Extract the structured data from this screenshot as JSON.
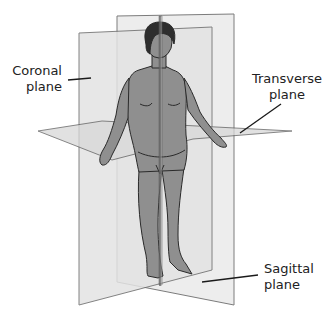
{
  "diagram": {
    "labels": {
      "coronal": {
        "line1": "Coronal",
        "line2": "plane"
      },
      "transverse": {
        "line1": "Transverse",
        "line2": "plane"
      },
      "sagittal": {
        "line1": "Sagittal",
        "line2": "plane"
      }
    },
    "colors": {
      "plane_fill": "#e6e6e6",
      "plane_stroke": "#6e6e6e",
      "body_fill": "#8f8f8f",
      "body_stroke": "#2a2a2a",
      "hair": "#2e2e2e",
      "leader_line": "#1a1a1a"
    }
  }
}
